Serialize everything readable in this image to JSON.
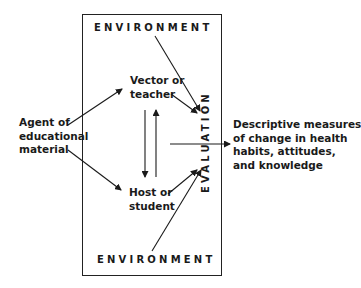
{
  "diagram": {
    "environment_top": "ENVIRONMENT",
    "environment_bottom": "ENVIRONMENT",
    "vector": [
      "Vector or",
      "teacher"
    ],
    "host": [
      "Host or",
      "student"
    ],
    "agent": [
      "Agent of",
      "educational",
      "material"
    ],
    "evaluation": "EVALUATION",
    "outcome": [
      "Descriptive measures",
      "of change in health",
      "habits, attitudes,",
      "and knowledge"
    ],
    "colors": {
      "ink": "#1a1a1a",
      "background": "#ffffff"
    }
  }
}
